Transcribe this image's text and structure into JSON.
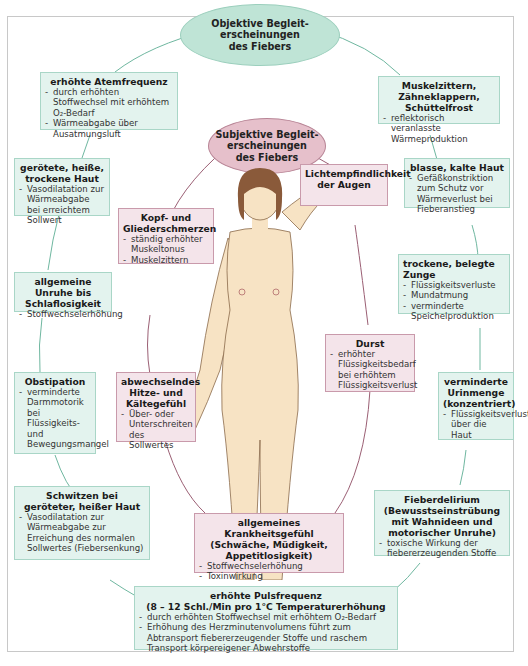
{
  "diagram": {
    "center_objective": "Objektive Begleit-erscheinungen des Fiebers",
    "center_objective_lines": [
      "Objektive Begleit-",
      "erscheinungen",
      "des Fiebers"
    ],
    "center_subjective_lines": [
      "Subjektive Begleit-",
      "erscheinungen",
      "des Fiebers"
    ],
    "colors": {
      "objective_fill": "#e3f3ee",
      "objective_border": "#a9d6c7",
      "objective_ellipse": "#bfe4d6",
      "subjective_fill": "#f4e4ea",
      "subjective_border": "#c99aab",
      "subjective_ellipse": "#e6c0cb",
      "objective_line": "#6fb7a0",
      "subjective_line": "#9b5f74",
      "skin": "#f7e3c4",
      "hair": "#8a5a3a"
    },
    "objective": [
      {
        "title": "erhöhte Atemfrequenz",
        "items": [
          "durch erhöhten Stoffwechsel mit erhöhtem O₂-Bedarf",
          "Wärmeabgabe über Ausatmungsluft"
        ]
      },
      {
        "title": "gerötete, heiße, trockene Haut",
        "items": [
          "Vasodilatation zur Wärmeabgabe bei erreichtem Sollwert"
        ]
      },
      {
        "title": "allgemeine Unruhe bis Schlaflosigkeit",
        "items": [
          "Stoffwechselerhöhung"
        ]
      },
      {
        "title": "Obstipation",
        "items": [
          "verminderte Darmmotorik bei Flüssigkeits- und Bewegungsmangel"
        ]
      },
      {
        "title": "Schwitzen bei geröteter, heißer Haut",
        "items": [
          "Vasodilatation zur Wärmeabgabe zur Erreichung des normalen Sollwertes (Fiebersenkung)"
        ]
      },
      {
        "title": "Muskelzittern, Zähneklappern, Schüttelfrost",
        "items": [
          "reflektorisch veranlasste Wärmeproduktion"
        ]
      },
      {
        "title": "blasse, kalte Haut",
        "items": [
          "Gefäßkonstriktion zum Schutz vor Wärmeverlust bei Fieberanstieg"
        ]
      },
      {
        "title": "trockene, belegte Zunge",
        "items": [
          "Flüssigkeitsverluste",
          "Mundatmung",
          "verminderte Speichelproduktion"
        ]
      },
      {
        "title": "verminderte Urinmenge (konzentriert)",
        "items": [
          "Flüssigkeitsverluste über die Haut"
        ]
      },
      {
        "title": "Fieberdelirium (Bewusstseinstrübung mit Wahnideen und motorischer Unruhe)",
        "items": [
          "toxische Wirkung der fiebererzeugenden Stoffe"
        ]
      },
      {
        "title": "erhöhte Pulsfrequenz",
        "subtitle": "(8 – 12 Schl./Min pro 1°C Temperaturerhöhung",
        "items": [
          "durch erhöhten Stoffwechsel mit erhöhtem O₂-Bedarf",
          "Erhöhung des Herzminutenvolumens führt zum Abtransport fiebererzeugender Stoffe und raschem Transport körpereigener Abwehrstoffe"
        ]
      }
    ],
    "subjective": [
      {
        "title": "Kopf- und Gliederschmerzen",
        "items": [
          "ständig erhöhter Muskeltonus",
          "Muskelzittern"
        ]
      },
      {
        "title": "Lichtempfindlichkeit der Augen",
        "items": []
      },
      {
        "title": "abwechselndes Hitze- und Kältegefühl",
        "items": [
          "Über- oder Unterschreiten des Sollwertes"
        ]
      },
      {
        "title": "Durst",
        "items": [
          "erhöhter Flüssigkeitsbedarf bei erhöhtem Flüssigkeitsverlust"
        ]
      },
      {
        "title": "allgemeines Krankheitsgefühl (Schwäche, Müdigkeit, Appetitlosigkeit)",
        "items": [
          "Stoffwechselerhöhung",
          "Toxinwirkung"
        ]
      }
    ]
  }
}
